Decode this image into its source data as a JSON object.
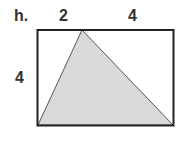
{
  "problem_label": "h.",
  "dimensions": {
    "top_left": "2",
    "top_right": "4",
    "left": "4"
  },
  "colors": {
    "fill": "#d9d9d9",
    "stroke": "#222222"
  }
}
